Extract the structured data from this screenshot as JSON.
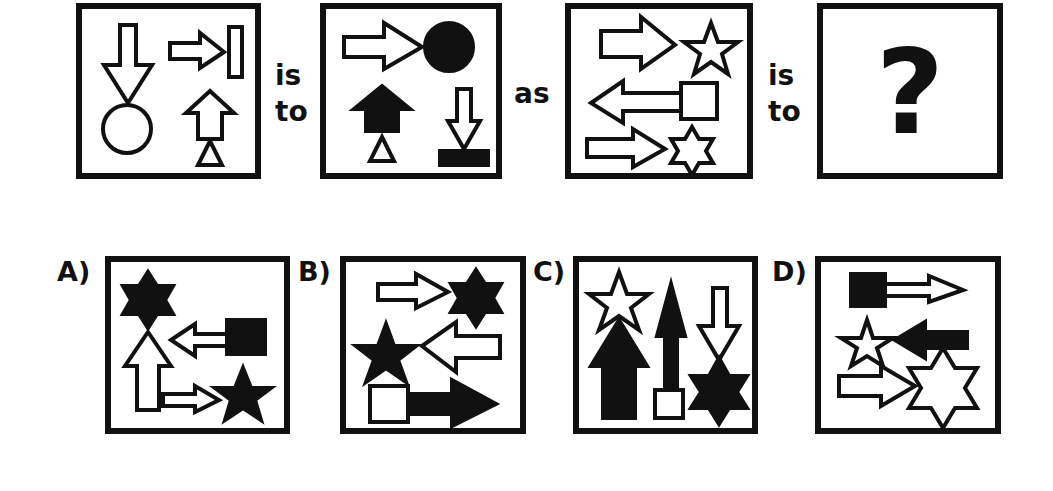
{
  "puzzle": {
    "type": "visual-analogy",
    "connectors": {
      "is_to_1": [
        "is",
        "to"
      ],
      "as": "as",
      "is_to_2": [
        "is",
        "to"
      ]
    },
    "unknown_symbol": "?",
    "panels": [
      {
        "id": "panel-1",
        "contents": [
          "hollow down arrow pointing to hollow circle",
          "hollow right arrow pointing to hollow tall rectangle",
          "hollow up arrow on top of hollow triangle"
        ]
      },
      {
        "id": "panel-2",
        "contents": [
          "hollow right arrow pointing to filled circle",
          "filled up arrow on top of hollow triangle",
          "hollow down arrow pointing to filled flat rectangle"
        ]
      },
      {
        "id": "panel-3",
        "contents": [
          "hollow right arrow pointing to hollow 5-point star",
          "hollow left arrow from hollow square",
          "hollow right arrow pointing to hollow 6-point star"
        ]
      },
      {
        "id": "panel-4",
        "contents": [
          "question mark"
        ]
      }
    ]
  },
  "options": [
    {
      "label": "A)",
      "contents": [
        "filled 6-point star above hollow up arrow",
        "hollow left arrow from filled square",
        "hollow right arrow pointing to filled 5-point star"
      ]
    },
    {
      "label": "B)",
      "contents": [
        "hollow right arrow pointing to filled 6-point star",
        "hollow left arrow pointing to filled 5-point star",
        "hollow square with filled right arrow"
      ]
    },
    {
      "label": "C)",
      "contents": [
        "hollow 5-point star above filled up arrow",
        "filled up arrow from hollow square",
        "hollow down arrow pointing to filled 6-point star"
      ]
    },
    {
      "label": "D)",
      "contents": [
        "filled square with hollow right arrow",
        "filled left arrow pointing to hollow 5-point star",
        "hollow right arrow pointing to hollow 6-point star"
      ]
    }
  ],
  "colors": {
    "ink": "#111111",
    "background": "#ffffff"
  }
}
